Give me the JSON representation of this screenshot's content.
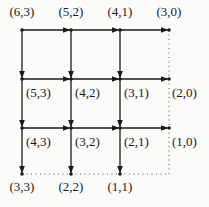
{
  "diagram": {
    "type": "grid-state-graph",
    "colors": {
      "edge": "#1a1a1a",
      "dotted": "#555555",
      "background": "#fbfbf9"
    },
    "nodes": [
      {
        "id": "6,3",
        "label": "(6,3)",
        "x": 22,
        "y": 30,
        "lx": 22,
        "ly": 16,
        "anchor": "middle"
      },
      {
        "id": "5,2",
        "label": "(5,2)",
        "x": 71,
        "y": 30,
        "lx": 71,
        "ly": 16,
        "anchor": "middle"
      },
      {
        "id": "4,1",
        "label": "(4,1)",
        "x": 120,
        "y": 30,
        "lx": 120,
        "ly": 16,
        "anchor": "middle"
      },
      {
        "id": "3,0",
        "label": "(3,0)",
        "x": 169,
        "y": 30,
        "lx": 169,
        "ly": 16,
        "anchor": "middle"
      },
      {
        "id": "5,3",
        "label": "(5,3)",
        "x": 22,
        "y": 79,
        "lx": 26,
        "ly": 97,
        "anchor": "start"
      },
      {
        "id": "4,2",
        "label": "(4,2)",
        "x": 71,
        "y": 79,
        "lx": 75,
        "ly": 97,
        "anchor": "start"
      },
      {
        "id": "3,1",
        "label": "(3,1)",
        "x": 120,
        "y": 79,
        "lx": 124,
        "ly": 97,
        "anchor": "start"
      },
      {
        "id": "2,0",
        "label": "(2,0)",
        "x": 169,
        "y": 79,
        "lx": 172,
        "ly": 97,
        "anchor": "start"
      },
      {
        "id": "4,3",
        "label": "(4,3)",
        "x": 22,
        "y": 128,
        "lx": 26,
        "ly": 146,
        "anchor": "start"
      },
      {
        "id": "3,2",
        "label": "(3,2)",
        "x": 71,
        "y": 128,
        "lx": 75,
        "ly": 146,
        "anchor": "start"
      },
      {
        "id": "2,1",
        "label": "(2,1)",
        "x": 120,
        "y": 128,
        "lx": 124,
        "ly": 146,
        "anchor": "start"
      },
      {
        "id": "1,0",
        "label": "(1,0)",
        "x": 169,
        "y": 128,
        "lx": 172,
        "ly": 146,
        "anchor": "start"
      },
      {
        "id": "3,3",
        "label": "(3,3)",
        "x": 22,
        "y": 174,
        "lx": 22,
        "ly": 191,
        "anchor": "middle"
      },
      {
        "id": "2,2",
        "label": "(2,2)",
        "x": 71,
        "y": 174,
        "lx": 71,
        "ly": 191,
        "anchor": "middle"
      },
      {
        "id": "1,1",
        "label": "(1,1)",
        "x": 120,
        "y": 174,
        "lx": 120,
        "ly": 191,
        "anchor": "middle"
      }
    ],
    "edges": [
      {
        "from": "6,3",
        "to": "5,2",
        "style": "solid",
        "arrow": true
      },
      {
        "from": "5,2",
        "to": "4,1",
        "style": "solid",
        "arrow": true
      },
      {
        "from": "4,1",
        "to": "3,0",
        "style": "solid",
        "arrow": true
      },
      {
        "from": "5,3",
        "to": "4,2",
        "style": "solid",
        "arrow": true
      },
      {
        "from": "4,2",
        "to": "3,1",
        "style": "solid",
        "arrow": true
      },
      {
        "from": "3,1",
        "to": "2,0",
        "style": "solid",
        "arrow": true
      },
      {
        "from": "4,3",
        "to": "3,2",
        "style": "solid",
        "arrow": true
      },
      {
        "from": "3,2",
        "to": "2,1",
        "style": "solid",
        "arrow": true
      },
      {
        "from": "2,1",
        "to": "1,0",
        "style": "solid",
        "arrow": true
      },
      {
        "from": "6,3",
        "to": "5,3",
        "style": "solid",
        "arrow": true
      },
      {
        "from": "5,3",
        "to": "4,3",
        "style": "solid",
        "arrow": true
      },
      {
        "from": "4,3",
        "to": "3,3",
        "style": "solid",
        "arrow": true
      },
      {
        "from": "5,2",
        "to": "4,2",
        "style": "solid",
        "arrow": true
      },
      {
        "from": "4,2",
        "to": "3,2",
        "style": "solid",
        "arrow": true
      },
      {
        "from": "3,2",
        "to": "2,2",
        "style": "solid",
        "arrow": true
      },
      {
        "from": "4,1",
        "to": "3,1",
        "style": "solid",
        "arrow": true
      },
      {
        "from": "3,1",
        "to": "2,1",
        "style": "solid",
        "arrow": true
      },
      {
        "from": "2,1",
        "to": "1,1",
        "style": "solid",
        "arrow": true
      },
      {
        "from": "3,0",
        "to": "2,0",
        "style": "dotted",
        "arrow": false
      },
      {
        "from": "2,0",
        "to": "1,0",
        "style": "dotted",
        "arrow": false
      },
      {
        "from": "1,0",
        "to": "corner",
        "style": "dotted",
        "arrow": false
      },
      {
        "from": "3,3",
        "to": "2,2",
        "style": "dotted",
        "arrow": false
      },
      {
        "from": "2,2",
        "to": "1,1",
        "style": "dotted",
        "arrow": false
      },
      {
        "from": "1,1",
        "to": "corner",
        "style": "dotted",
        "arrow": false
      }
    ],
    "corner": {
      "x": 169,
      "y": 174
    }
  }
}
